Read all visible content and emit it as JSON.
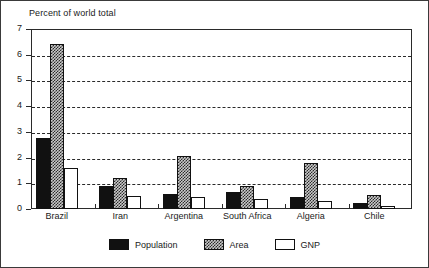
{
  "chart_data": {
    "type": "bar",
    "title": "Percent of world total",
    "xlabel": "",
    "ylabel": "",
    "ylim": [
      0,
      7
    ],
    "yticks": [
      0,
      1,
      2,
      3,
      4,
      5,
      6,
      7
    ],
    "ytick_labels": [
      "0",
      "1",
      "2",
      "3",
      "4",
      "5",
      "6",
      "7"
    ],
    "grid": "horizontal dashed gridlines at 1,2,3,4,5,6",
    "gridlines": [
      1,
      2,
      3,
      4,
      5,
      6
    ],
    "legend_position": "bottom-center",
    "categories": [
      "Brazil",
      "Iran",
      "Argentina",
      "South Africa",
      "Algeria",
      "Chile"
    ],
    "series": [
      {
        "name": "Population",
        "fill": "solid-black",
        "color": "#111111",
        "values": [
          2.75,
          0.9,
          0.6,
          0.65,
          0.45,
          0.25
        ]
      },
      {
        "name": "Area",
        "fill": "checkered-gray",
        "color": "#c9c9c9",
        "values": [
          6.4,
          1.2,
          2.05,
          0.9,
          1.8,
          0.55
        ]
      },
      {
        "name": "GNP",
        "fill": "white",
        "color": "#ffffff",
        "values": [
          1.6,
          0.5,
          0.45,
          0.4,
          0.3,
          0.1
        ]
      }
    ]
  },
  "legend": {
    "items": [
      {
        "label": "Population",
        "swatch": "population"
      },
      {
        "label": "Area",
        "swatch": "area"
      },
      {
        "label": "GNP",
        "swatch": "gnp"
      }
    ]
  }
}
